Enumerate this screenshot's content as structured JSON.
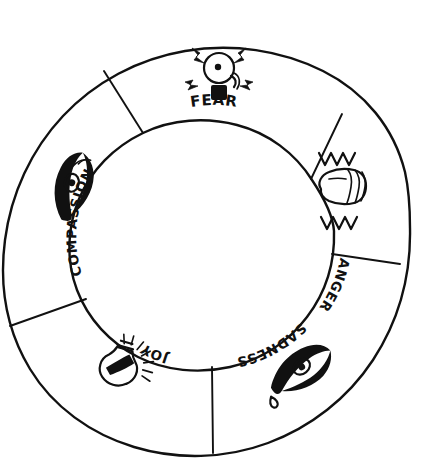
{
  "diagram": {
    "style": "hand-drawn sketch, black ink on white",
    "shape": "annulus divided into five segments",
    "background_color": "#ffffff",
    "ink_color": "#111111",
    "center": {
      "x": 214,
      "y": 232
    },
    "outer_radius": 196,
    "inner_radius": 120,
    "segment_count": 5
  },
  "segments": [
    {
      "id": "fear",
      "label": "FEAR",
      "label_position": "inner-ring-top",
      "label_orientation": "upright, curved along inner circle",
      "icon_name": "alarm-bell-icon",
      "icon_description": "alarm bell with ringing clapper, square base and four lightning bolts radiating outward",
      "angle_start_deg": -54,
      "angle_end_deg": -126,
      "icon_x": 219,
      "icon_y": 74
    },
    {
      "id": "anger",
      "label": "ANGER",
      "label_position": "inner-ring-right",
      "label_orientation": "rotated, reading downward along inner circle",
      "icon_name": "clenched-fist-icon",
      "icon_description": "clenched fist with zigzag shake lines above and below",
      "angle_start_deg": -54,
      "angle_end_deg": 18,
      "icon_x": 343,
      "icon_y": 185
    },
    {
      "id": "sadness",
      "label": "SADNESS",
      "label_position": "inner-ring-bottom-right",
      "label_orientation": "rotated, upside down along inner circle",
      "icon_name": "crying-eye-icon",
      "icon_description": "almond eye with a falling teardrop",
      "angle_start_deg": 18,
      "angle_end_deg": 90,
      "icon_x": 300,
      "icon_y": 370
    },
    {
      "id": "joy",
      "label": "JOY",
      "label_position": "inner-ring-bottom-left",
      "label_orientation": "rotated, upside down along inner circle",
      "icon_name": "lightbulb-icon",
      "icon_description": "glowing lightbulb with radiating spark lines",
      "angle_start_deg": 90,
      "angle_end_deg": 162,
      "icon_x": 122,
      "icon_y": 366
    },
    {
      "id": "compassion",
      "label": "COMPASSION",
      "label_position": "inner-ring-left",
      "label_orientation": "rotated, reading upward along inner circle",
      "icon_name": "eye-icon",
      "icon_description": "open almond eye with pupil and lash strokes",
      "angle_start_deg": 162,
      "angle_end_deg": 234,
      "icon_x": 72,
      "icon_y": 185
    }
  ],
  "spokes": [
    {
      "id": "spoke-compassion-fear",
      "angle_deg": -126
    },
    {
      "id": "spoke-fear-anger",
      "angle_deg": -54
    },
    {
      "id": "spoke-anger-sadness",
      "angle_deg": 18
    },
    {
      "id": "spoke-sadness-joy",
      "angle_deg": 90
    },
    {
      "id": "spoke-joy-compassion",
      "angle_deg": 162
    }
  ]
}
